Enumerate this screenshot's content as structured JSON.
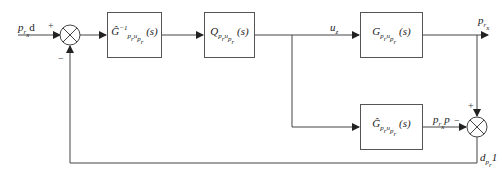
{
  "diagram": {
    "type": "control-block-diagram",
    "inputs": {
      "reference": "p_{r_x}d",
      "reference_sign": "+",
      "feedback_sign": "−"
    },
    "blocks": [
      {
        "id": "inv_model",
        "label": "Ĝ⁻¹",
        "sub": "p_r u_{p_r}",
        "arg": "(s)"
      },
      {
        "id": "filter",
        "label": "Q",
        "sub": "p_r u_{p_r}",
        "arg": "(s)"
      },
      {
        "id": "plant",
        "label": "G",
        "sub": "p_r u_{p_r}",
        "arg": "(s)"
      },
      {
        "id": "model",
        "label": "Ĝ",
        "sub": "p_r u_{p_r}",
        "arg": "(s)"
      }
    ],
    "signals": {
      "control": "u_z",
      "output": "p_{r_x}",
      "model_output": "p_{r_x}p",
      "model_output_sign": "−",
      "plant_output_sign": "+",
      "disturbance": "d_{p_r}1"
    }
  }
}
